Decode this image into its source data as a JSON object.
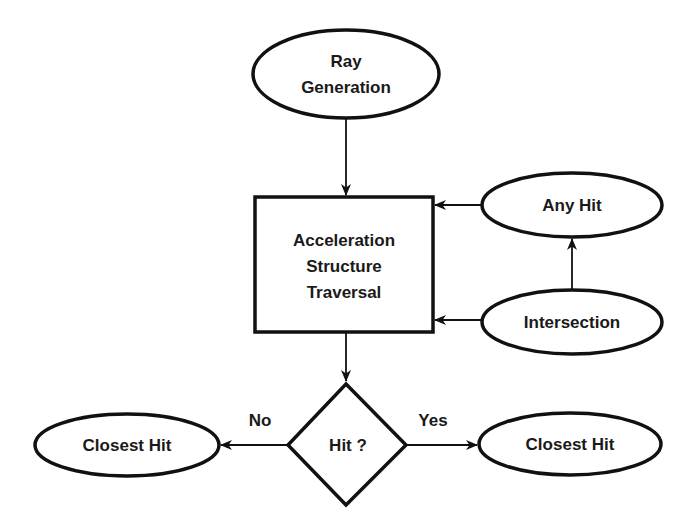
{
  "diagram": {
    "type": "flowchart",
    "nodes": {
      "ray_generation": {
        "shape": "ellipse",
        "line1": "Ray",
        "line2": "Generation"
      },
      "traversal": {
        "shape": "rectangle",
        "line1": "Acceleration",
        "line2": "Structure",
        "line3": "Traversal"
      },
      "any_hit": {
        "shape": "ellipse",
        "label": "Any Hit"
      },
      "intersection": {
        "shape": "ellipse",
        "label": "Intersection"
      },
      "hit_decision": {
        "shape": "diamond",
        "label": "Hit ?"
      },
      "closest_hit_left": {
        "shape": "ellipse",
        "label": "Closest Hit"
      },
      "closest_hit_right": {
        "shape": "ellipse",
        "label": "Closest Hit"
      }
    },
    "edges": [
      {
        "from": "ray_generation",
        "to": "traversal",
        "label": ""
      },
      {
        "from": "any_hit",
        "to": "traversal",
        "label": ""
      },
      {
        "from": "intersection",
        "to": "traversal",
        "label": ""
      },
      {
        "from": "intersection",
        "to": "any_hit",
        "label": ""
      },
      {
        "from": "traversal",
        "to": "hit_decision",
        "label": ""
      },
      {
        "from": "hit_decision",
        "to": "closest_hit_left",
        "label": "No"
      },
      {
        "from": "hit_decision",
        "to": "closest_hit_right",
        "label": "Yes"
      }
    ],
    "edge_labels": {
      "no": "No",
      "yes": "Yes"
    },
    "colors": {
      "stroke": "#111111",
      "fill": "#ffffff",
      "text": "#1a1a1a"
    }
  }
}
